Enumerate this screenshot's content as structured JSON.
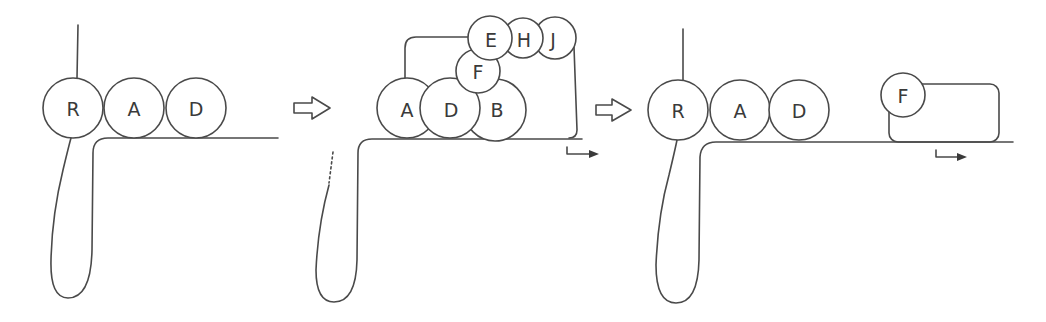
{
  "diagram": {
    "panels": [
      {
        "id": "panel-1",
        "circles": [
          {
            "label": "R",
            "cx": 73,
            "cy": 108,
            "r": 30
          },
          {
            "label": "A",
            "cx": 134,
            "cy": 108,
            "r": 30
          },
          {
            "label": "D",
            "cx": 196,
            "cy": 108,
            "r": 30
          }
        ]
      },
      {
        "id": "panel-2",
        "circles": [
          {
            "label": "A",
            "cx": 407,
            "cy": 108,
            "r": 30
          },
          {
            "label": "B",
            "cx": 495,
            "cy": 110,
            "r": 31
          },
          {
            "label": "D",
            "cx": 450,
            "cy": 108,
            "r": 30
          },
          {
            "label": "F",
            "cx": 478,
            "cy": 71,
            "r": 22
          },
          {
            "label": "E",
            "cx": 490,
            "cy": 38,
            "r": 22
          },
          {
            "label": "H",
            "cx": 523,
            "cy": 38,
            "r": 20
          },
          {
            "label": "J",
            "cx": 555,
            "cy": 38,
            "r": 21
          }
        ]
      },
      {
        "id": "panel-3",
        "circles": [
          {
            "label": "R",
            "cx": 678,
            "cy": 110,
            "r": 30
          },
          {
            "label": "A",
            "cx": 740,
            "cy": 110,
            "r": 30
          },
          {
            "label": "D",
            "cx": 799,
            "cy": 110,
            "r": 30
          },
          {
            "label": "F",
            "cx": 903,
            "cy": 95,
            "r": 22
          }
        ]
      }
    ],
    "transition_arrows": [
      {
        "name": "step-1-to-2",
        "x": 294,
        "y": 108
      },
      {
        "name": "step-2-to-3",
        "x": 596,
        "y": 110
      }
    ],
    "colors": {
      "stroke": "#4a4a4a",
      "text": "#3a3a3a",
      "background": "#ffffff"
    }
  }
}
